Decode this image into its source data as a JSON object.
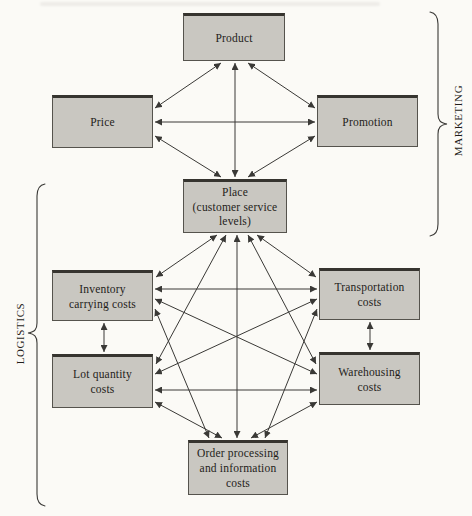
{
  "groups": {
    "marketing": {
      "label": "MARKETING"
    },
    "logistics": {
      "label": "LOGISTICS"
    }
  },
  "nodes": [
    {
      "id": "product",
      "label": "Product"
    },
    {
      "id": "price",
      "label": "Price"
    },
    {
      "id": "promotion",
      "label": "Promotion"
    },
    {
      "id": "place",
      "label": "Place\n(customer service\nlevels)"
    },
    {
      "id": "inventory",
      "label": "Inventory\ncarrying costs"
    },
    {
      "id": "transportation",
      "label": "Transportation\ncosts"
    },
    {
      "id": "lot",
      "label": "Lot quantity\ncosts"
    },
    {
      "id": "warehousing",
      "label": "Warehousing\ncosts"
    },
    {
      "id": "order",
      "label": "Order processing\nand information\ncosts"
    }
  ],
  "edges": [
    {
      "from": "price",
      "to": "product",
      "x1": 155,
      "y1": 108,
      "x2": 221,
      "y2": 63
    },
    {
      "from": "promotion",
      "to": "product",
      "x1": 315,
      "y1": 108,
      "x2": 248,
      "y2": 63
    },
    {
      "from": "price",
      "to": "promotion",
      "x1": 155,
      "y1": 122,
      "x2": 315,
      "y2": 122
    },
    {
      "from": "product",
      "to": "place",
      "x1": 235,
      "y1": 63,
      "x2": 235,
      "y2": 177
    },
    {
      "from": "price",
      "to": "place",
      "x1": 155,
      "y1": 136,
      "x2": 221,
      "y2": 177
    },
    {
      "from": "promotion",
      "to": "place",
      "x1": 315,
      "y1": 136,
      "x2": 248,
      "y2": 177
    },
    {
      "from": "place",
      "to": "inventory",
      "x1": 217,
      "y1": 235,
      "x2": 156,
      "y2": 277
    },
    {
      "from": "place",
      "to": "lot",
      "x1": 226,
      "y1": 235,
      "x2": 156,
      "y2": 364
    },
    {
      "from": "place",
      "to": "order",
      "x1": 237,
      "y1": 235,
      "x2": 237,
      "y2": 438
    },
    {
      "from": "place",
      "to": "warehousing",
      "x1": 248,
      "y1": 235,
      "x2": 316,
      "y2": 364
    },
    {
      "from": "place",
      "to": "transportation",
      "x1": 257,
      "y1": 235,
      "x2": 316,
      "y2": 277
    },
    {
      "from": "inventory",
      "to": "transportation",
      "x1": 155,
      "y1": 289,
      "x2": 317,
      "y2": 289
    },
    {
      "from": "inventory",
      "to": "warehousing",
      "x1": 155,
      "y1": 299,
      "x2": 317,
      "y2": 374
    },
    {
      "from": "inventory",
      "to": "order",
      "x1": 155,
      "y1": 309,
      "x2": 209,
      "y2": 438
    },
    {
      "from": "inventory",
      "to": "lot",
      "x1": 104,
      "y1": 323,
      "x2": 104,
      "y2": 352
    },
    {
      "from": "transportation",
      "to": "lot",
      "x1": 317,
      "y1": 299,
      "x2": 155,
      "y2": 374
    },
    {
      "from": "transportation",
      "to": "order",
      "x1": 317,
      "y1": 309,
      "x2": 265,
      "y2": 438
    },
    {
      "from": "transportation",
      "to": "warehousing",
      "x1": 370,
      "y1": 322,
      "x2": 370,
      "y2": 350
    },
    {
      "from": "lot",
      "to": "warehousing",
      "x1": 155,
      "y1": 390,
      "x2": 317,
      "y2": 390
    },
    {
      "from": "lot",
      "to": "order",
      "x1": 155,
      "y1": 402,
      "x2": 222,
      "y2": 438
    },
    {
      "from": "warehousing",
      "to": "order",
      "x1": 317,
      "y1": 402,
      "x2": 251,
      "y2": 438
    }
  ],
  "colors": {
    "background": "#fbfaf6",
    "box_fill": "#c9c7c1",
    "box_border": "#55534d",
    "line": "#3a3936",
    "text": "#1f1d1a"
  }
}
